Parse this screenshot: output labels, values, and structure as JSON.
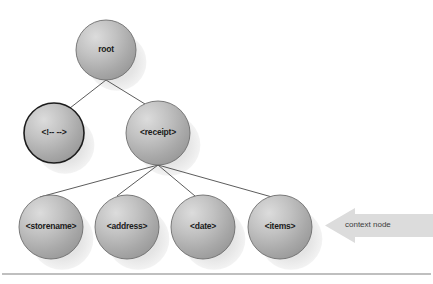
{
  "diagram": {
    "background_color": "#ffffff",
    "node_fill": "#b4b4b4",
    "node_highlight": "#d8d8d8",
    "node_stroke": "#6e6e6e",
    "node_stroke_emphasis": "#1c1c1c",
    "shadow_color": "#e2e2e2",
    "edge_color": "#4a4a4a",
    "label_color": "#1a1a1a",
    "arrow_fill": "#dcdcdc",
    "arrow_text_color": "#3c3c3c",
    "footer_rule_color": "#808080",
    "nodes": [
      {
        "id": "root",
        "label": "root",
        "cx": 106,
        "cy": 50,
        "r": 30,
        "emphasis": false,
        "font_size": 8.5
      },
      {
        "id": "comment",
        "label": "<!-- -->",
        "cx": 54,
        "cy": 133,
        "r": 30,
        "emphasis": true,
        "font_size": 8.5
      },
      {
        "id": "receipt",
        "label": "<receipt>",
        "cx": 158,
        "cy": 133,
        "r": 32,
        "emphasis": false,
        "font_size": 8.5
      },
      {
        "id": "storename",
        "label": "<storename>",
        "cx": 51,
        "cy": 227,
        "r": 32,
        "emphasis": false,
        "font_size": 8.5
      },
      {
        "id": "address",
        "label": "<address>",
        "cx": 127,
        "cy": 227,
        "r": 32,
        "emphasis": false,
        "font_size": 8.5
      },
      {
        "id": "date",
        "label": "<date>",
        "cx": 203,
        "cy": 227,
        "r": 32,
        "emphasis": false,
        "font_size": 8.5
      },
      {
        "id": "items",
        "label": "<items>",
        "cx": 280,
        "cy": 227,
        "r": 32,
        "emphasis": false,
        "font_size": 8.5
      }
    ],
    "edges": [
      {
        "from": "root",
        "to": "comment",
        "x1": 106,
        "y1": 80,
        "x2": 70,
        "y2": 108
      },
      {
        "from": "root",
        "to": "receipt",
        "x1": 106,
        "y1": 80,
        "x2": 145,
        "y2": 104
      },
      {
        "from": "receipt",
        "to": "storename",
        "x1": 158,
        "y1": 165,
        "x2": 40,
        "y2": 197
      },
      {
        "from": "receipt",
        "to": "address",
        "x1": 158,
        "y1": 165,
        "x2": 117,
        "y2": 196
      },
      {
        "from": "receipt",
        "to": "date",
        "x1": 158,
        "y1": 165,
        "x2": 195,
        "y2": 196
      },
      {
        "from": "receipt",
        "to": "items",
        "x1": 158,
        "y1": 165,
        "x2": 272,
        "y2": 197
      }
    ],
    "annotation": {
      "label": "context node",
      "points_to": "items",
      "arrow": {
        "tip_x": 325,
        "top_y": 208,
        "bottom_y": 243,
        "head_end_x": 355,
        "body_top_y": 214,
        "body_bottom_y": 237,
        "tail_x": 433
      },
      "text_x": 345,
      "text_y": 226,
      "font_size": 8
    },
    "footer_rule": {
      "x1": 2,
      "y1": 274,
      "x2": 431,
      "y2": 274
    }
  }
}
